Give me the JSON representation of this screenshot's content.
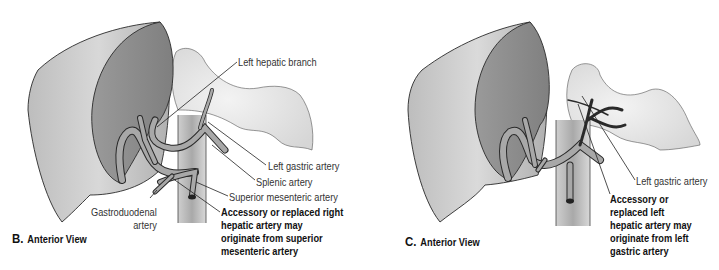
{
  "figure": {
    "panels": [
      {
        "id": "B",
        "caption_letter": "B.",
        "caption_text": "Anterior View",
        "labels": {
          "left_hepatic_branch": "Left hepatic branch",
          "left_gastric_artery": "Left gastric artery",
          "splenic_artery": "Splenic artery",
          "superior_mesenteric_artery": "Superior mesenteric artery",
          "gastroduodenal_line1": "Gastroduodenal",
          "gastroduodenal_line2": "artery",
          "note_lines": [
            "Accessory or replaced right",
            "hepatic artery may",
            "originate from superior",
            "mesenteric artery"
          ]
        }
      },
      {
        "id": "C",
        "caption_letter": "C.",
        "caption_text": "Anterior View",
        "labels": {
          "left_gastric_artery": "Left gastric artery",
          "note_lines": [
            "Accessory or",
            "replaced left",
            "hepatic artery may",
            "originate from left",
            "gastric artery"
          ]
        }
      }
    ],
    "colors": {
      "liver_outer": "#c9c9c9",
      "liver_inner": "#8f8f8f",
      "artery": "#a5a5a5",
      "aorta": "#b8b8b8",
      "stomach": "#e4e4e4",
      "outline": "#2a2a2a"
    }
  }
}
